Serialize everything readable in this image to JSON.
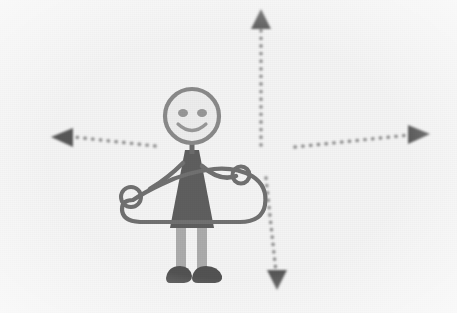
{
  "image": {
    "title": "Stick figure holding a large object with four directional dotted arrows",
    "width": 457,
    "height": 313,
    "background_color": "#fefefe",
    "style": "low-resolution grayscale scanned line drawing",
    "alt_text": "A hand-drawn smiling stick figure in a dark dress holds a large rounded hoop-like object at waist height. Four dotted arrows point up, down, left and right around the figure."
  },
  "palette": {
    "background": "#fefefe",
    "ink_dark": "#4a4a4a",
    "ink_medium": "#7b7b7b",
    "ink_light": "#a8a8a8",
    "dress_fill": "#5c5c5c",
    "shoe_fill": "#4f4f4f",
    "leg_fill": "#b0b0b0",
    "arrow_color": "#8a8a8a",
    "arrowhead_color": "#555555"
  },
  "figure": {
    "name": "stick-figure",
    "head": {
      "label": "head",
      "cx": 192,
      "cy": 116,
      "r": 27,
      "stroke": "#8b8b8b",
      "fill": "#f6f6f6"
    },
    "face": {
      "label": "smiley-face",
      "left_eye": {
        "cx": 183,
        "cy": 113,
        "rx": 5,
        "ry": 4
      },
      "right_eye": {
        "cx": 202,
        "cy": 113,
        "rx": 5,
        "ry": 4
      },
      "smile": "curved upward arc"
    },
    "neck": {
      "label": "neck",
      "x1": 192,
      "y1": 143,
      "x2": 192,
      "y2": 156
    },
    "dress": {
      "label": "dress-body",
      "description": "dark filled triangular tunic widening downward",
      "top_y": 152,
      "bottom_y": 228,
      "top_width": 16,
      "bottom_width": 44,
      "fill": "#5c5c5c"
    },
    "left_arm": {
      "label": "left-arm",
      "description": "arm angled down-left toward the held object",
      "from": [
        182,
        165
      ],
      "to": [
        150,
        190
      ]
    },
    "right_arm": {
      "label": "right-arm",
      "description": "arm raised up-right ending in a round hand",
      "from": [
        203,
        168
      ],
      "to": [
        238,
        176
      ],
      "hand": {
        "cx": 241,
        "cy": 175,
        "r": 8
      }
    },
    "legs": {
      "label": "legs",
      "fill": "#b0b0b0",
      "left": {
        "x": 180,
        "y_top": 226,
        "y_bottom": 268,
        "width": 9
      },
      "right": {
        "x": 199,
        "y_top": 226,
        "y_bottom": 268,
        "width": 9
      }
    },
    "shoes": {
      "label": "shoes",
      "fill": "#4f4f4f",
      "left": {
        "cx": 180,
        "cy": 274
      },
      "right": {
        "cx": 203,
        "cy": 274
      }
    }
  },
  "held_object": {
    "name": "held-hoop-object",
    "label": "large rounded outlined object held across the waist",
    "left_x": 120,
    "right_x": 267,
    "top_y": 166,
    "bottom_y": 223,
    "stroke": "#6f6f6f",
    "knob": {
      "label": "left-knob-handle",
      "cx": 131,
      "cy": 197,
      "r": 10
    }
  },
  "arrows": [
    {
      "name": "arrow-up",
      "direction": "up",
      "line_from": [
        261,
        145
      ],
      "line_to": [
        261,
        26
      ],
      "head_at": [
        261,
        12
      ],
      "style": "dotted"
    },
    {
      "name": "arrow-down",
      "direction": "down",
      "line_from": [
        266,
        178
      ],
      "line_to": [
        276,
        272
      ],
      "head_at": [
        277,
        285
      ],
      "style": "dotted"
    },
    {
      "name": "arrow-left",
      "direction": "left",
      "line_from": [
        155,
        146
      ],
      "line_to": [
        74,
        137
      ],
      "head_at": [
        54,
        137
      ],
      "style": "dotted"
    },
    {
      "name": "arrow-right",
      "direction": "right",
      "line_from": [
        295,
        147
      ],
      "line_to": [
        409,
        135
      ],
      "head_at": [
        428,
        134
      ],
      "style": "dotted"
    }
  ]
}
